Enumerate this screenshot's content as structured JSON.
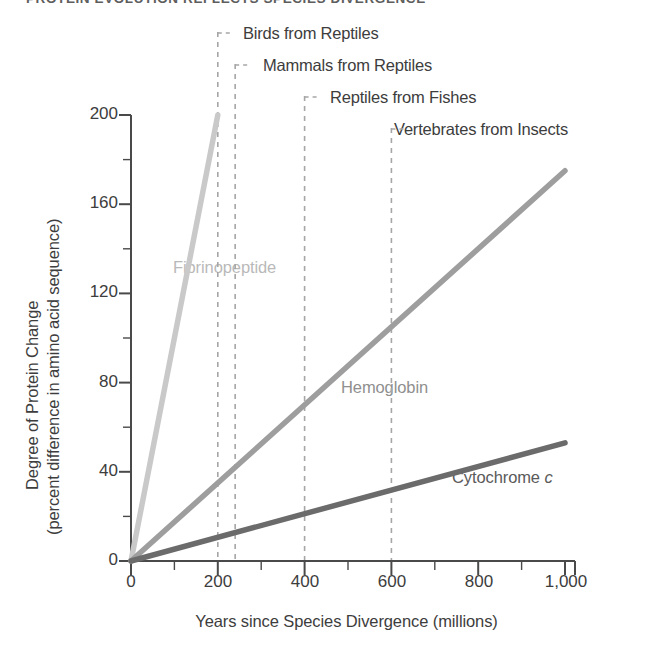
{
  "figure": {
    "title": "PROTEIN EVOLUTION REFLECTS SPECIES DIVERGENCE"
  },
  "chart_data": {
    "type": "line",
    "title": "PROTEIN EVOLUTION REFLECTS SPECIES DIVERGENCE",
    "xlabel": "Years since Species Divergence (millions)",
    "ylabel": "Degree of Protein Change (percent difference in amino acid sequence)",
    "ylabel_line1": "Degree of Protein Change",
    "ylabel_line2": "(percent difference in amino acid sequence)",
    "xlim": [
      0,
      1000
    ],
    "ylim": [
      0,
      200
    ],
    "grid": false,
    "legend_position": "inline-labels",
    "xticks": [
      0,
      200,
      400,
      600,
      800,
      1000
    ],
    "xtick_labels": [
      "0",
      "200",
      "400",
      "600",
      "800",
      "1,000"
    ],
    "xminor_step": 100,
    "yticks": [
      0,
      40,
      80,
      120,
      160,
      200
    ],
    "ytick_labels": [
      "0",
      "40",
      "80",
      "120",
      "160",
      "200"
    ],
    "yminor_step": 20,
    "series": [
      {
        "name": "Fibrinopeptide",
        "color": "#c9c9c9",
        "x": [
          0,
          200
        ],
        "values": [
          0,
          200
        ],
        "label_text": "Fibrinopeptide"
      },
      {
        "name": "Hemoglobin",
        "color": "#9e9e9e",
        "x": [
          0,
          1000
        ],
        "values": [
          0,
          175
        ],
        "label_text": "Hemoglobin"
      },
      {
        "name": "Cytochrome c",
        "color": "#6b6b6b",
        "x": [
          0,
          1000
        ],
        "values": [
          0,
          53
        ],
        "label_text": "Cytochrome ",
        "label_italic": "c"
      }
    ],
    "annotations": [
      {
        "label": "Birds from Reptiles",
        "x": 200
      },
      {
        "label": "Mammals from Reptiles",
        "x": 240
      },
      {
        "label": "Reptiles from Fishes",
        "x": 400
      },
      {
        "label": "Vertebrates from Insects",
        "x": 600
      }
    ],
    "colors": {
      "axis": "#4a4a4a",
      "text": "#3d3d3d",
      "annotation_line": "#a6a6a6",
      "fibrinopeptide": "#c9c9c9",
      "hemoglobin": "#9e9e9e",
      "cytochrome_c": "#6b6b6b"
    }
  }
}
